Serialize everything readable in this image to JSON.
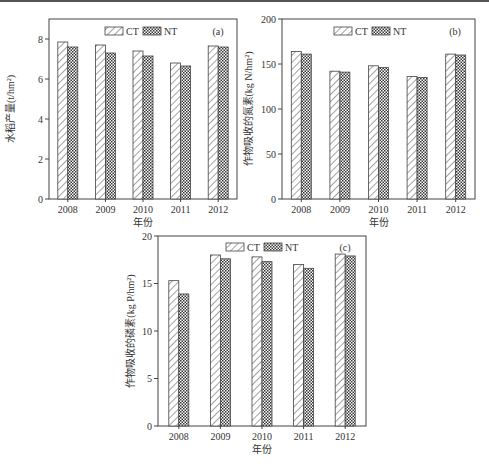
{
  "colors": {
    "axis": "#444444",
    "ct_fill": "#ffffff",
    "nt_fill": "#8a8a8a"
  },
  "legend": {
    "ct": "CT",
    "nt": "NT"
  },
  "chart_data": [
    {
      "type": "bar",
      "panel": "(a)",
      "title": "",
      "xlabel": "年份",
      "ylabel": "水稻产量(t/hm²)",
      "categories": [
        "2008",
        "2009",
        "2010",
        "2011",
        "2012"
      ],
      "series": [
        {
          "name": "CT",
          "values": [
            7.85,
            7.7,
            7.4,
            6.8,
            7.65
          ]
        },
        {
          "name": "NT",
          "values": [
            7.6,
            7.3,
            7.15,
            6.65,
            7.6
          ]
        }
      ],
      "ylim": [
        0,
        9
      ],
      "yticks": [
        0,
        2,
        4,
        6,
        8
      ],
      "grid": false,
      "legend_position": "top-center"
    },
    {
      "type": "bar",
      "panel": "(b)",
      "title": "",
      "xlabel": "年份",
      "ylabel": "作物吸收的氮素(kg N/hm²)",
      "categories": [
        "2008",
        "2009",
        "2010",
        "2011",
        "2012"
      ],
      "series": [
        {
          "name": "CT",
          "values": [
            164,
            142,
            148,
            136,
            161
          ]
        },
        {
          "name": "NT",
          "values": [
            161,
            141,
            146,
            135,
            160
          ]
        }
      ],
      "ylim": [
        0,
        200
      ],
      "yticks": [
        0,
        50,
        100,
        150,
        200
      ],
      "grid": false,
      "legend_position": "top-center"
    },
    {
      "type": "bar",
      "panel": "(c)",
      "title": "",
      "xlabel": "年份",
      "ylabel": "作物吸收的磷素(kg P/hm²)",
      "categories": [
        "2008",
        "2009",
        "2010",
        "2011",
        "2012"
      ],
      "series": [
        {
          "name": "CT",
          "values": [
            15.3,
            18.0,
            17.8,
            17.0,
            18.1
          ]
        },
        {
          "name": "NT",
          "values": [
            13.9,
            17.6,
            17.3,
            16.6,
            17.9
          ]
        }
      ],
      "ylim": [
        0,
        20
      ],
      "yticks": [
        0,
        5,
        10,
        15,
        20
      ],
      "grid": false,
      "legend_position": "top-center"
    }
  ]
}
